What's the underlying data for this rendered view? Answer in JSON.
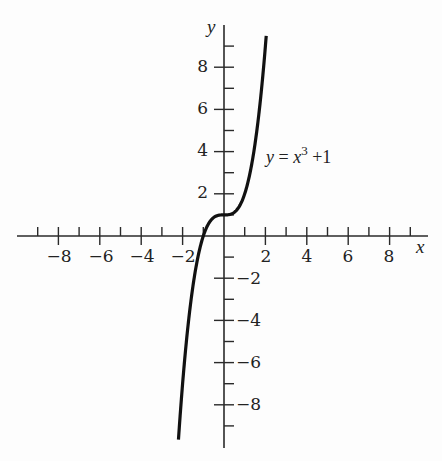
{
  "chart_data": {
    "type": "line",
    "title": "",
    "xlabel": "x",
    "ylabel": "y",
    "xlim": [
      -9.8,
      9.8
    ],
    "ylim": [
      -10.2,
      10.2
    ],
    "grid": false,
    "legend": null,
    "x_ticks": [
      -9,
      -8,
      -7,
      -6,
      -5,
      -4,
      -3,
      -2,
      -1,
      1,
      2,
      3,
      4,
      5,
      6,
      7,
      8,
      9
    ],
    "x_tick_labels": [
      "-8",
      "-6",
      "-4",
      "-2",
      "2",
      "4",
      "6",
      "8"
    ],
    "y_ticks": [
      -9,
      -8,
      -7,
      -6,
      -5,
      -4,
      -3,
      -2,
      -1,
      1,
      2,
      3,
      4,
      5,
      6,
      7,
      8,
      9
    ],
    "y_tick_labels": [
      "8",
      "6",
      "4",
      "2",
      "-2",
      "-4",
      "-6",
      "-8"
    ],
    "series": [
      {
        "name": "y = x^3 + 1",
        "function": "x^3 + 1",
        "x": [
          -2.2,
          -2.0,
          -1.5,
          -1.0,
          -0.5,
          0,
          0.5,
          1.0,
          1.5,
          2.0,
          2.05
        ],
        "values": [
          -9.65,
          -7,
          -2.375,
          0,
          0.875,
          1,
          1.125,
          2,
          4.375,
          9,
          9.62
        ]
      }
    ],
    "annotations": [
      {
        "text": "y = x³ + 1",
        "x": 2.1,
        "y": 3.8
      }
    ]
  },
  "labels": {
    "x_axis": "x",
    "y_axis": "y",
    "eq_y": "y",
    "eq_eq": " = ",
    "eq_x": "x",
    "eq_exp": "3",
    "eq_plus": " +1",
    "xt": {
      "m8": "−8",
      "m6": "−6",
      "m4": "−4",
      "m2": "−2",
      "p2": "2",
      "p4": "4",
      "p6": "6",
      "p8": "8"
    },
    "yt": {
      "p8": "8",
      "p6": "6",
      "p4": "4",
      "p2": "2",
      "m2": "−2",
      "m4": "−4",
      "m6": "−6",
      "m8": "−8"
    }
  },
  "colors": {
    "axis": "#2a2a2a",
    "curve": "#111111",
    "background": "#fdfdfd"
  }
}
